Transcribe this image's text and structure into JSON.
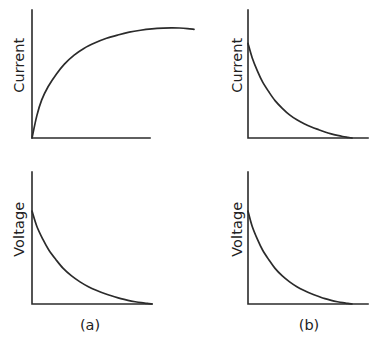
{
  "figure": {
    "background_color": "#ffffff",
    "line_color": "#2b2b2b",
    "width": 379,
    "height": 345
  },
  "captions": {
    "left": "(a)",
    "right": "(b)"
  },
  "axis_labels": {
    "current": "Current",
    "voltage": "Voltage"
  },
  "chart_data": [
    {
      "id": "top-left",
      "type": "line",
      "title": "",
      "xlabel": "",
      "ylabel": "Current",
      "caption": "(a)",
      "grid": false,
      "legend": "none",
      "axis_style": "two-axis-corner",
      "xlim": [
        0,
        1
      ],
      "ylim": [
        0,
        1
      ],
      "description": "Charging current rises steeply from the origin, saturates near the maximum and droops very slightly at the right end.",
      "x": [
        0.0,
        0.03,
        0.06,
        0.1,
        0.15,
        0.2,
        0.26,
        0.32,
        0.39,
        0.46,
        0.53,
        0.6,
        0.67,
        0.74,
        0.81,
        0.86,
        0.91,
        0.96,
        1.0
      ],
      "y": [
        0.0,
        0.2,
        0.34,
        0.46,
        0.57,
        0.66,
        0.74,
        0.8,
        0.85,
        0.89,
        0.92,
        0.945,
        0.962,
        0.974,
        0.981,
        0.983,
        0.982,
        0.977,
        0.97
      ]
    },
    {
      "id": "top-right",
      "type": "line",
      "title": "",
      "xlabel": "",
      "ylabel": "Current",
      "caption": "(b)",
      "grid": false,
      "legend": "none",
      "axis_style": "two-axis-corner",
      "xlim": [
        0,
        1
      ],
      "ylim": [
        0,
        1
      ],
      "description": "Discharge current decays exponentially from a high initial value down to zero at the right of the axis.",
      "x": [
        0.0,
        0.04,
        0.09,
        0.14,
        0.2,
        0.26,
        0.33,
        0.4,
        0.47,
        0.54,
        0.61,
        0.68,
        0.74,
        0.8,
        0.86,
        0.91,
        0.96,
        1.0
      ],
      "y": [
        0.86,
        0.73,
        0.61,
        0.51,
        0.42,
        0.34,
        0.27,
        0.21,
        0.165,
        0.13,
        0.1,
        0.075,
        0.055,
        0.038,
        0.024,
        0.014,
        0.006,
        0.0
      ]
    },
    {
      "id": "bottom-left",
      "type": "line",
      "title": "",
      "xlabel": "",
      "ylabel": "Voltage",
      "caption": "(a)",
      "grid": false,
      "legend": "none",
      "axis_style": "two-axis-corner",
      "xlim": [
        0,
        1
      ],
      "ylim": [
        0,
        1
      ],
      "description": "Voltage decays exponentially from a high initial value toward zero along the horizontal axis.",
      "x": [
        0.0,
        0.04,
        0.09,
        0.14,
        0.2,
        0.26,
        0.33,
        0.4,
        0.47,
        0.54,
        0.61,
        0.68,
        0.74,
        0.8,
        0.86,
        0.91,
        0.96,
        1.0
      ],
      "y": [
        0.86,
        0.72,
        0.6,
        0.5,
        0.41,
        0.33,
        0.26,
        0.205,
        0.16,
        0.125,
        0.095,
        0.07,
        0.05,
        0.034,
        0.021,
        0.012,
        0.005,
        0.0
      ]
    },
    {
      "id": "bottom-right",
      "type": "line",
      "title": "",
      "xlabel": "",
      "ylabel": "Voltage",
      "caption": "(b)",
      "grid": false,
      "legend": "none",
      "axis_style": "two-axis-corner",
      "xlim": [
        0,
        1
      ],
      "ylim": [
        0,
        1
      ],
      "description": "Voltage decays exponentially from a high initial value toward zero along the horizontal axis.",
      "x": [
        0.0,
        0.04,
        0.09,
        0.14,
        0.2,
        0.26,
        0.33,
        0.4,
        0.47,
        0.54,
        0.61,
        0.68,
        0.74,
        0.8,
        0.86,
        0.91,
        0.96,
        1.0
      ],
      "y": [
        0.86,
        0.72,
        0.6,
        0.5,
        0.41,
        0.33,
        0.26,
        0.205,
        0.16,
        0.125,
        0.095,
        0.07,
        0.05,
        0.034,
        0.021,
        0.012,
        0.005,
        0.0
      ]
    }
  ]
}
